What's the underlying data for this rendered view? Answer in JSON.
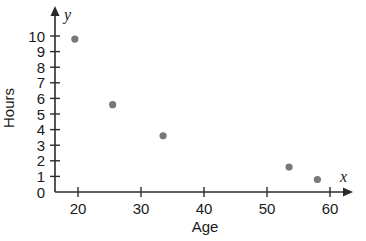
{
  "chart_data": {
    "type": "scatter",
    "title": "",
    "xlabel": "Age",
    "ylabel": "Hours",
    "x_axis_symbol": "x",
    "y_axis_symbol": "y",
    "xlim": [
      15,
      65
    ],
    "ylim": [
      0,
      10
    ],
    "grid": false,
    "legend": null,
    "x_ticks": [
      20,
      30,
      40,
      50,
      60
    ],
    "y_ticks": [
      0,
      1,
      2,
      3,
      4,
      5,
      6,
      7,
      8,
      9,
      10
    ],
    "x_tick_labels": [
      "20",
      "30",
      "40",
      "50",
      "60"
    ],
    "y_tick_labels": [
      "0",
      "1",
      "2",
      "3",
      "4",
      "5",
      "6",
      "7",
      "8",
      "9",
      "10"
    ],
    "series": [
      {
        "name": "Hours vs Age",
        "color": "#787878",
        "points": [
          {
            "x": 19.5,
            "y": 9.8
          },
          {
            "x": 25.5,
            "y": 5.6
          },
          {
            "x": 33.5,
            "y": 3.6
          },
          {
            "x": 53.5,
            "y": 1.6
          },
          {
            "x": 58.0,
            "y": 0.8
          }
        ]
      }
    ]
  }
}
